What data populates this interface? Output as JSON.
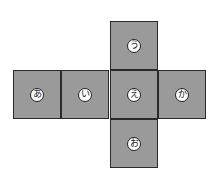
{
  "diagram": {
    "type": "cube-net",
    "cells": [
      {
        "label": "う",
        "position": "top",
        "left": 110,
        "top": 21
      },
      {
        "label": "あ",
        "position": "middle-1",
        "left": 13,
        "top": 70
      },
      {
        "label": "い",
        "position": "middle-2",
        "left": 61,
        "top": 70
      },
      {
        "label": "え",
        "position": "middle-3",
        "left": 110,
        "top": 70
      },
      {
        "label": "か",
        "position": "middle-4",
        "left": 158,
        "top": 70
      },
      {
        "label": "お",
        "position": "bottom",
        "left": 110,
        "top": 119
      }
    ],
    "colors": {
      "face": "#9a9a9a",
      "border": "#2a2a2a",
      "badge": "#ffffff"
    }
  }
}
